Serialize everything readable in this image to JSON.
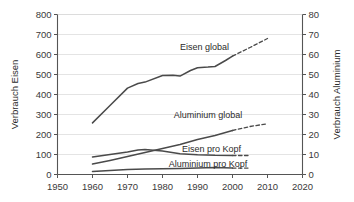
{
  "chart_data": {
    "type": "line",
    "title": "",
    "subtitle": "",
    "xlabel": "",
    "ylabel": "Verbrauch Eisen",
    "y2label": "Verbrauch Aluminium",
    "xlim": [
      1950,
      2020
    ],
    "ylim": [
      0,
      800
    ],
    "y2lim": [
      0,
      80
    ],
    "xticks": [
      1950,
      1960,
      1970,
      1980,
      1990,
      2000,
      2010,
      2020
    ],
    "xticklabels": [
      "1950",
      "1960",
      "1970",
      "1980",
      "1990",
      "2000",
      "2010",
      "2020"
    ],
    "yticks": [
      0,
      100,
      200,
      300,
      400,
      500,
      600,
      700,
      800
    ],
    "yticklabels": [
      "0",
      "100",
      "200",
      "300",
      "400",
      "500",
      "600",
      "700",
      "800"
    ],
    "y2ticks": [
      0,
      10,
      20,
      30,
      40,
      50,
      60,
      70,
      80
    ],
    "y2ticklabels": [
      "0",
      "10",
      "20",
      "30",
      "40",
      "50",
      "60",
      "70",
      "80"
    ],
    "grid": "horizontal",
    "legend_position": "inline-labels",
    "line_color": "#4a4a4a",
    "series": [
      {
        "name": "Eisen global",
        "axis": "left",
        "label": "Eisen global",
        "label_x": 1992,
        "label_y": 640,
        "x": [
          1960,
          1965,
          1970,
          1973,
          1975,
          1980,
          1983,
          1985,
          1988,
          1990,
          1993,
          1995,
          1998,
          2000
        ],
        "values": [
          258,
          345,
          432,
          455,
          462,
          495,
          496,
          492,
          520,
          534,
          537,
          540,
          570,
          592
        ],
        "projection_x": [
          2000,
          2005,
          2010
        ],
        "projection_values": [
          592,
          635,
          680
        ]
      },
      {
        "name": "Aluminium global",
        "axis": "right",
        "label": "Aluminium global",
        "label_x": 1993,
        "label_y": 30,
        "x": [
          1960,
          1965,
          1970,
          1975,
          1980,
          1985,
          1990,
          1995,
          2000
        ],
        "values": [
          5.2,
          7.0,
          9.0,
          11.0,
          13.0,
          15.0,
          17.5,
          19.5,
          22.0
        ],
        "projection_x": [
          2000,
          2005,
          2010
        ],
        "projection_values": [
          22.0,
          24.0,
          25.4
        ]
      },
      {
        "name": "Eisen pro Kopf",
        "axis": "left",
        "label": "Eisen pro Kopf",
        "label_x": 1994,
        "label_y": 128,
        "x": [
          1960,
          1965,
          1970,
          1973,
          1975,
          1980,
          1985,
          1990,
          1995,
          2000
        ],
        "values": [
          88,
          100,
          112,
          122,
          125,
          118,
          104,
          99,
          96,
          95
        ],
        "projection_x": [
          2000,
          2005
        ],
        "projection_values": [
          95,
          95
        ]
      },
      {
        "name": "Aluminium pro Kopf",
        "axis": "right",
        "label": "Aluminium pro Kopf",
        "label_x": 1993,
        "label_y": 5.6,
        "x": [
          1960,
          1965,
          1970,
          1975,
          1980,
          1985,
          1990,
          1995,
          2000
        ],
        "values": [
          1.5,
          2.0,
          2.5,
          2.7,
          2.9,
          3.0,
          3.2,
          3.5,
          3.2
        ],
        "projection_x": [
          2000,
          2005
        ],
        "projection_values": [
          3.2,
          3.2
        ]
      }
    ]
  }
}
